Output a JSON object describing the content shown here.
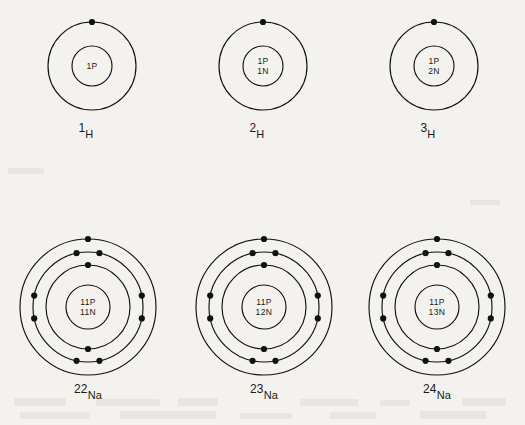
{
  "figure": {
    "background_color": "#f4f2ee",
    "ink_color": "#111111",
    "width": 525,
    "height": 425
  },
  "atoms": [
    {
      "id": "hydrogen-1",
      "element": "H",
      "mass_number": "1",
      "label_mass": "1",
      "label_symbol": "H",
      "center_x": 92,
      "center_y": 66,
      "nucleus_radius": 20,
      "nucleus_lines": [
        "1P"
      ],
      "protons": "1P",
      "neutrons": "",
      "shells": [
        {
          "radius": 44,
          "electron_angles": [
            270
          ]
        }
      ],
      "label_x": 86,
      "label_y": 122
    },
    {
      "id": "hydrogen-2",
      "element": "H",
      "mass_number": "2",
      "label_mass": "2",
      "label_symbol": "H",
      "center_x": 263,
      "center_y": 66,
      "nucleus_radius": 20,
      "nucleus_lines": [
        "1P",
        "1N"
      ],
      "protons": "1P",
      "neutrons": "1N",
      "shells": [
        {
          "radius": 44,
          "electron_angles": [
            270
          ]
        }
      ],
      "label_x": 257,
      "label_y": 122
    },
    {
      "id": "hydrogen-3",
      "element": "H",
      "mass_number": "3",
      "label_mass": "3",
      "label_symbol": "H",
      "center_x": 434,
      "center_y": 66,
      "nucleus_radius": 20,
      "nucleus_lines": [
        "1P",
        "2N"
      ],
      "protons": "1P",
      "neutrons": "2N",
      "shells": [
        {
          "radius": 44,
          "electron_angles": [
            270
          ]
        }
      ],
      "label_x": 428,
      "label_y": 122
    },
    {
      "id": "sodium-22",
      "element": "Na",
      "mass_number": "22",
      "label_mass": "22",
      "label_symbol": "Na",
      "center_x": 88,
      "center_y": 307,
      "nucleus_radius": 22,
      "nucleus_lines": [
        "11P",
        "11N"
      ],
      "protons": "11P",
      "neutrons": "11N",
      "shells": [
        {
          "radius": 42,
          "electron_angles": [
            270,
            90
          ]
        },
        {
          "radius": 55,
          "electron_angles": [
            258,
            282,
            78,
            102,
            168,
            192,
            348,
            12
          ]
        },
        {
          "radius": 68,
          "electron_angles": [
            270
          ]
        }
      ],
      "label_x": 88,
      "label_y": 383
    },
    {
      "id": "sodium-23",
      "element": "Na",
      "mass_number": "23",
      "label_mass": "23",
      "label_symbol": "Na",
      "center_x": 264,
      "center_y": 307,
      "nucleus_radius": 22,
      "nucleus_lines": [
        "11P",
        "12N"
      ],
      "protons": "11P",
      "neutrons": "12N",
      "shells": [
        {
          "radius": 42,
          "electron_angles": [
            270,
            90
          ]
        },
        {
          "radius": 55,
          "electron_angles": [
            258,
            282,
            78,
            102,
            168,
            192,
            348,
            12
          ]
        },
        {
          "radius": 68,
          "electron_angles": [
            270
          ]
        }
      ],
      "label_x": 264,
      "label_y": 383
    },
    {
      "id": "sodium-24",
      "element": "Na",
      "mass_number": "24",
      "label_mass": "24",
      "label_symbol": "Na",
      "center_x": 437,
      "center_y": 307,
      "nucleus_radius": 22,
      "nucleus_lines": [
        "11P",
        "13N"
      ],
      "protons": "11P",
      "neutrons": "13N",
      "shells": [
        {
          "radius": 42,
          "electron_angles": [
            270,
            90
          ]
        },
        {
          "radius": 55,
          "electron_angles": [
            258,
            282,
            78,
            102,
            168,
            192,
            348,
            12
          ]
        },
        {
          "radius": 68,
          "electron_angles": [
            270
          ]
        }
      ],
      "label_x": 437,
      "label_y": 383
    }
  ],
  "electron_dot_radius": 3.1,
  "bleed_marks": [
    {
      "x": 14,
      "y": 398,
      "w": 52,
      "h": 8
    },
    {
      "x": 96,
      "y": 399,
      "w": 64,
      "h": 7
    },
    {
      "x": 178,
      "y": 398,
      "w": 40,
      "h": 8
    },
    {
      "x": 300,
      "y": 399,
      "w": 58,
      "h": 7
    },
    {
      "x": 380,
      "y": 400,
      "w": 30,
      "h": 6
    },
    {
      "x": 462,
      "y": 398,
      "w": 44,
      "h": 8
    },
    {
      "x": 20,
      "y": 412,
      "w": 70,
      "h": 7
    },
    {
      "x": 120,
      "y": 411,
      "w": 96,
      "h": 8
    },
    {
      "x": 240,
      "y": 413,
      "w": 52,
      "h": 6
    },
    {
      "x": 330,
      "y": 412,
      "w": 46,
      "h": 7
    },
    {
      "x": 420,
      "y": 411,
      "w": 66,
      "h": 8
    },
    {
      "x": 8,
      "y": 168,
      "w": 36,
      "h": 6
    },
    {
      "x": 470,
      "y": 200,
      "w": 30,
      "h": 5
    }
  ]
}
